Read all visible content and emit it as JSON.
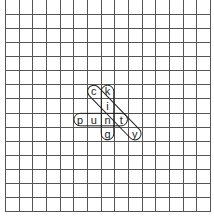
{
  "puzzle": {
    "type": "word-search",
    "columns": 15,
    "rows": 15,
    "grid_color": "#555555",
    "outline_color": "#222222",
    "letters": [
      {
        "row": 6,
        "col": 6,
        "char": "c"
      },
      {
        "row": 6,
        "col": 7,
        "char": "k"
      },
      {
        "row": 7,
        "col": 7,
        "char": "i"
      },
      {
        "row": 8,
        "col": 5,
        "char": "p"
      },
      {
        "row": 8,
        "col": 6,
        "char": "u"
      },
      {
        "row": 8,
        "col": 7,
        "char": "n"
      },
      {
        "row": 8,
        "col": 8,
        "char": "t"
      },
      {
        "row": 9,
        "col": 7,
        "char": "g"
      },
      {
        "row": 9,
        "col": 9,
        "char": "y"
      }
    ],
    "words": [
      {
        "word": "punt",
        "start": [
          8,
          5
        ],
        "end": [
          8,
          8
        ],
        "direction": "horizontal"
      },
      {
        "word": "king",
        "start": [
          6,
          7
        ],
        "end": [
          9,
          7
        ],
        "direction": "vertical"
      },
      {
        "word": "city",
        "start": [
          6,
          6
        ],
        "end": [
          9,
          9
        ],
        "direction": "diagonal"
      }
    ]
  }
}
